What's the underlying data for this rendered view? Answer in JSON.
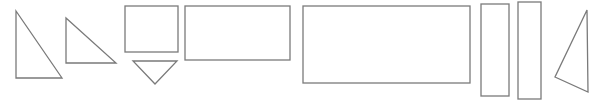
{
  "diagram": {
    "width": 592,
    "height": 100,
    "stroke_color": "#7a7a7a",
    "background": "#ffffff",
    "shapes": [
      {
        "id": "right-triangle-large",
        "type": "polygon",
        "points": "16,11 16,78 62,78"
      },
      {
        "id": "right-triangle-medium",
        "type": "polygon",
        "points": "66,18 66,63 116,63"
      },
      {
        "id": "square",
        "type": "rect",
        "x": 125,
        "y": 6,
        "w": 53,
        "h": 46
      },
      {
        "id": "inverted-triangle",
        "type": "polygon",
        "points": "133,61 177,61 155,84"
      },
      {
        "id": "rectangle-medium",
        "type": "rect",
        "x": 185,
        "y": 6,
        "w": 105,
        "h": 54
      },
      {
        "id": "rectangle-large",
        "type": "rect",
        "x": 303,
        "y": 6,
        "w": 167,
        "h": 77
      },
      {
        "id": "tall-rectangle-left",
        "type": "rect",
        "x": 481,
        "y": 4,
        "w": 28,
        "h": 92
      },
      {
        "id": "tall-rectangle-right",
        "type": "rect",
        "x": 518,
        "y": 2,
        "w": 23,
        "h": 97
      },
      {
        "id": "scalene-triangle",
        "type": "polygon",
        "points": "587,10 555,77 588,92"
      }
    ]
  }
}
